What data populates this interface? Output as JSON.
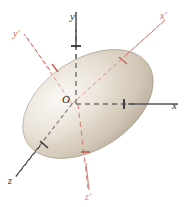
{
  "figure": {
    "type": "3d-geometry-diagram",
    "width": 185,
    "height": 207,
    "background": "#ffffff"
  },
  "colors": {
    "primary_axis": "#55555a",
    "primary_axis_dark": "#3a3a3a",
    "rotated_axis": "#d06a63",
    "rotated_axis_light": "#e0a29b",
    "ellipsoid_fill_light": "#ece5da",
    "ellipsoid_fill_mid": "#d9cfc0",
    "ellipsoid_fill_dark": "#b8ab99",
    "ellipsoid_outline": "#a2947f",
    "origin_label": "#262626"
  },
  "origin": {
    "label": "O",
    "x": 72,
    "y": 104
  },
  "axes": {
    "primary": [
      {
        "name": "x-axis",
        "label": "x",
        "color": "#55555a",
        "style": "solid",
        "direction": "right",
        "label_x": 172,
        "label_y": 100,
        "tick": true
      },
      {
        "name": "y-axis",
        "label": "y",
        "color": "#55555a",
        "style": "solid-outside-dashed-inside",
        "direction": "up",
        "label_x": 70,
        "label_y": 11,
        "tick": true
      },
      {
        "name": "z-axis",
        "label": "z",
        "color": "#3a3a3a",
        "style": "dashed",
        "direction": "lower-left",
        "label_x": 8,
        "label_y": 176,
        "tick": true
      }
    ],
    "rotated": [
      {
        "name": "x-prime-axis",
        "label": "x'",
        "color": "#d06a63",
        "style": "dashed",
        "direction": "upper-right",
        "label_x": 160,
        "label_y": 11,
        "tick": true
      },
      {
        "name": "y-prime-axis",
        "label": "y'",
        "color": "#d06a63",
        "style": "dashed",
        "direction": "upper-left",
        "label_x": 13,
        "label_y": 29,
        "tick": true
      },
      {
        "name": "z-prime-axis",
        "label": "z'",
        "color": "#d06a63",
        "style": "solid",
        "direction": "down",
        "label_x": 85,
        "label_y": 192,
        "tick": true
      }
    ]
  },
  "ellipsoid": {
    "center_x": 88,
    "center_y": 104,
    "semi_major": 72,
    "semi_minor": 45,
    "rotation_deg": -33
  }
}
